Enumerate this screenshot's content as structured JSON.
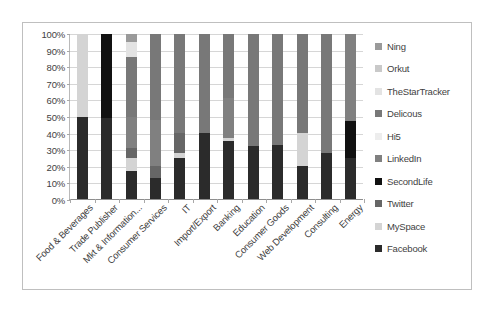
{
  "chart_data": {
    "type": "bar",
    "subtype": "100% stacked bar",
    "title": "",
    "xlabel": "",
    "ylabel": "",
    "ylim": [
      0,
      100
    ],
    "y_tick_labels": [
      "100%",
      "90%",
      "80%",
      "70%",
      "60%",
      "50%",
      "40%",
      "30%",
      "20%",
      "10%",
      "0%"
    ],
    "y_tick_values": [
      100,
      90,
      80,
      70,
      60,
      50,
      40,
      30,
      20,
      10,
      0
    ],
    "grid": true,
    "legend_position": "right",
    "legend_order_top_to_bottom": [
      "Ning",
      "Orkut",
      "TheStarTracker",
      "Delicous",
      "Hi5",
      "LinkedIn",
      "SecondLife",
      "Twitter",
      "MySpace",
      "Facebook"
    ],
    "categories": [
      "Food & Beverages",
      "Trade Publisher",
      "Mkt & Information...",
      "Consumer Services",
      "IT",
      "Import/Export",
      "Banking",
      "Education",
      "Consumer Goods",
      "Web Development",
      "Consulting",
      "Energy"
    ],
    "series": [
      {
        "name": "Facebook",
        "color": "#2b2b2b",
        "values": [
          50,
          49,
          17,
          13,
          25,
          40,
          35,
          32,
          33,
          20,
          28,
          25
        ]
      },
      {
        "name": "MySpace",
        "color": "#d4d4d4",
        "values": [
          50,
          0,
          8,
          0,
          3,
          0,
          2,
          0,
          0,
          20,
          0,
          0
        ]
      },
      {
        "name": "Twitter",
        "color": "#666666",
        "values": [
          0,
          0,
          6,
          7,
          12,
          0,
          0,
          0,
          0,
          0,
          0,
          0
        ]
      },
      {
        "name": "SecondLife",
        "color": "#111111",
        "values": [
          0,
          51,
          0,
          0,
          0,
          0,
          0,
          0,
          0,
          0,
          0,
          22
        ]
      },
      {
        "name": "LinkedIn",
        "color": "#808080",
        "values": [
          0,
          0,
          19,
          28,
          0,
          0,
          24,
          0,
          0,
          0,
          0,
          53
        ]
      },
      {
        "name": "Hi5",
        "color": "#ededed",
        "values": [
          0,
          0,
          0,
          0,
          0,
          0,
          0,
          0,
          0,
          0,
          0,
          0
        ]
      },
      {
        "name": "Delicous",
        "color": "#787878",
        "values": [
          0,
          0,
          36,
          52,
          60,
          60,
          39,
          68,
          67,
          60,
          72,
          0
        ]
      },
      {
        "name": "TheStarTracker",
        "color": "#e3e3e3",
        "values": [
          0,
          0,
          9,
          0,
          0,
          0,
          0,
          0,
          0,
          0,
          0,
          0
        ]
      },
      {
        "name": "Orkut",
        "color": "#c9c9c9",
        "values": [
          0,
          0,
          0,
          0,
          0,
          0,
          0,
          0,
          0,
          0,
          0,
          0
        ]
      },
      {
        "name": "Ning",
        "color": "#9a9a9a",
        "values": [
          0,
          0,
          5,
          0,
          0,
          0,
          0,
          0,
          0,
          0,
          0,
          0
        ]
      }
    ]
  }
}
